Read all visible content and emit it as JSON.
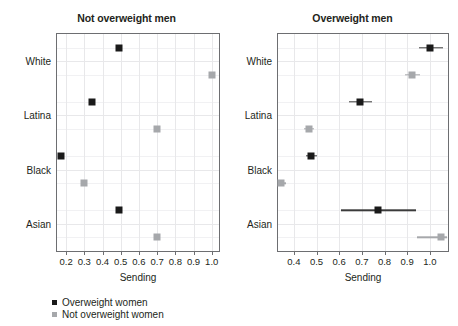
{
  "chart_data": {
    "type": "scatter",
    "title": "",
    "xlabel": "Sending",
    "ylabel": "",
    "grid": true,
    "legend_position": "bottom-left",
    "legend": [
      {
        "name": "Overweight women",
        "color": "#1a1a1a",
        "marker": "square"
      },
      {
        "name": "Not overweight women",
        "color": "#a6a8ab",
        "marker": "square"
      }
    ],
    "categories": [
      "White",
      "Latina",
      "Black",
      "Asian"
    ],
    "panels": [
      {
        "title": "Not overweight men",
        "xlabel": "Sending",
        "xlim": [
          0.15,
          1.04
        ],
        "xticks": [
          0.2,
          0.3,
          0.4,
          0.5,
          0.6,
          0.7,
          0.8,
          0.9,
          1.0
        ],
        "xticklabels": [
          "0.2",
          "0.3",
          "0.4",
          "0.5",
          "0.6",
          "0.7",
          "0.8",
          "0.9",
          "1.0"
        ],
        "has_error_bars": false,
        "series": [
          {
            "name": "Overweight women",
            "color": "#1a1a1a",
            "points": [
              {
                "category": "White",
                "value": 0.49
              },
              {
                "category": "Latina",
                "value": 0.34
              },
              {
                "category": "Black",
                "value": 0.17
              },
              {
                "category": "Asian",
                "value": 0.49
              }
            ]
          },
          {
            "name": "Not overweight women",
            "color": "#a6a8ab",
            "points": [
              {
                "category": "White",
                "value": 1.0
              },
              {
                "category": "Latina",
                "value": 0.7
              },
              {
                "category": "Black",
                "value": 0.3
              },
              {
                "category": "Asian",
                "value": 0.7
              }
            ]
          }
        ]
      },
      {
        "title": "Overweight men",
        "xlabel": "Sending",
        "xlim": [
          0.33,
          1.08
        ],
        "xticks": [
          0.4,
          0.5,
          0.6,
          0.7,
          0.8,
          0.9,
          1.0
        ],
        "xticklabels": [
          "0.4",
          "0.5",
          "0.6",
          "0.7",
          "0.8",
          "0.9",
          "1.0"
        ],
        "has_error_bars": true,
        "series": [
          {
            "name": "Overweight women",
            "color": "#1a1a1a",
            "points": [
              {
                "category": "White",
                "value": 1.0,
                "low": 0.95,
                "high": 1.06
              },
              {
                "category": "Latina",
                "value": 0.69,
                "low": 0.645,
                "high": 0.745
              },
              {
                "category": "Black",
                "value": 0.475,
                "low": 0.455,
                "high": 0.5
              },
              {
                "category": "Asian",
                "value": 0.77,
                "low": 0.61,
                "high": 0.94
              }
            ]
          },
          {
            "name": "Not overweight women",
            "color": "#a6a8ab",
            "points": [
              {
                "category": "White",
                "value": 0.92,
                "low": 0.89,
                "high": 0.955
              },
              {
                "category": "Latina",
                "value": 0.465,
                "low": 0.445,
                "high": 0.49
              },
              {
                "category": "Black",
                "value": 0.345,
                "low": 0.33,
                "high": 0.365
              },
              {
                "category": "Asian",
                "value": 1.05,
                "low": 0.945,
                "high": 1.075
              }
            ]
          }
        ]
      }
    ]
  }
}
